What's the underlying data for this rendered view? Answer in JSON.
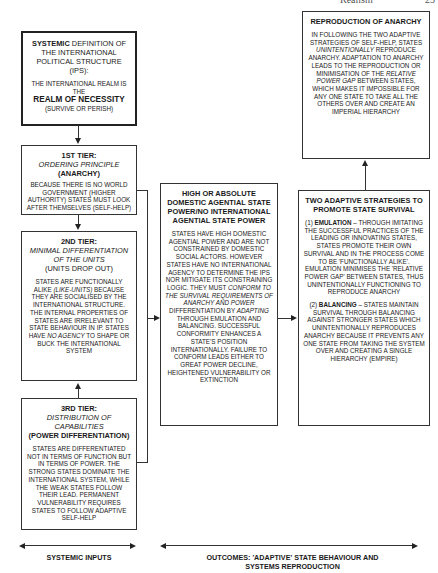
{
  "page_header": {
    "running_title": "Realism",
    "page_number": "25"
  },
  "left_column": {
    "systemic_definition": {
      "line1_bold": "SYSTEMIC",
      "line1_rest": " DEFINITION OF THE INTERNATIONAL POLITICAL STRUCTURE (IPS):",
      "body": "THE INTERNATIONAL REALM IS THE",
      "emphasis": "REALM OF NECESSITY",
      "note": "(SURVIVE OR PERISH)"
    },
    "tier1": {
      "title": "1ST TIER:",
      "subtitle": "ORDERING PRINCIPLE",
      "label": "(ANARCHY)",
      "body": "BECAUSE THERE IS NO WORLD GOVERNMENT (HIGHER AUTHORITY) STATES MUST LOOK AFTER THEMSELVES (SELF-HELP)"
    },
    "tier2": {
      "title": "2ND TIER:",
      "subtitle": "MINIMAL DIFFERENTIATION OF THE UNITS",
      "label": "(UNITS DROP OUT)",
      "body_a": "STATES ARE FUNCTIONALLY ALIKE ",
      "body_italic1": "(LIKE-UNITS)",
      "body_b": " BECAUSE THEY ARE SOCIALISED BY THE INTERNATIONAL STRUCTURE. THE INTERNAL PROPERTIES OF STATES ARE IRRELEVANT TO STATE BEHAVIOUR IN IP. STATES HAVE ",
      "body_italic2": "NO AGENCY",
      "body_c": " TO SHAPE OR BUCK THE INTERNATIONAL SYSTEM"
    },
    "tier3": {
      "title": "3RD TIER:",
      "subtitle": "DISTRIBUTION OF CAPABILITIES",
      "label": "(POWER DIFFERENTIATION)",
      "body": "STATES ARE DIFFERENTIATED NOT IN TERMS OF FUNCTION BUT IN TERMS OF POWER. THE STRONG STATES DOMINATE THE INTERNATIONAL SYSTEM, WHILE THE WEAK STATES FOLLOW THEIR LEAD. PERMANENT VULNERABILITY REQUIRES STATES TO FOLLOW ADAPTIVE SELF-HELP"
    }
  },
  "middle_column": {
    "agential_power": {
      "title": "HIGH OR ABSOLUTE DOMESTIC AGENTIAL STATE POWER/NO INTERNATIONAL AGENTIAL STATE POWER",
      "body_a": "STATES HAVE HIGH DOMESTIC AGENTIAL POWER AND ARE NOT CONSTRAINED BY DOMESTIC SOCIAL ACTORS. HOWEVER STATES HAVE NO INTERNATIONAL AGENCY TO DETERMINE THE IPS NOR MITIGATE ITS CONSTRAINING LOGIC. THEY MUST ",
      "body_italic1": "CONFORM TO THE SURVIVAL REQUIREMENTS OF ANARCHY AND POWER",
      "body_b": " DIFFERENTIATION BY ",
      "body_italic2": "ADAPTING",
      "body_c": " THROUGH EMULATION AND BALANCING. SUCCESSFUL CONFORMITY ENHANCES A STATE'S POSITION INTERNATIONALLY. FAILURE TO CONFORM LEADS EITHER TO GREAT POWER DECLINE, HEIGHTENED VULNERABILITY OR EXTINCTION"
    }
  },
  "right_column": {
    "reproduction": {
      "title": "REPRODUCTION OF ANARCHY",
      "body_a": "IN FOLLOWING THE TWO ADAPTIVE STRATEGIES OF SELF-HELP, STATES ",
      "body_italic1": "UNINTENTIONALLY",
      "body_b": " REPRODUCE ANARCHY. ADAPTATION TO ANARCHY LEADS TO THE REPRODUCTION OR MINIMISATION OF THE ",
      "body_italic2": "RELATIVE POWER GAP",
      "body_c": " BETWEEN STATES, WHICH MAKES IT IMPOSSIBLE FOR ANY ONE STATE TO TAKE ALL THE OTHERS OVER AND CREATE AN IMPERIAL HIERARCHY"
    },
    "strategies": {
      "title": "TWO ADAPTIVE STRATEGIES TO PROMOTE STATE SURVIVAL",
      "s1_num": "(1) ",
      "s1_name": "EMULATION",
      "s1_body": " – THROUGH IMITATING THE SUCCESSFUL PRACTICES OF THE LEADING OR INNOVATING STATES, STATES PROMOTE THEIR OWN SURVIVAL AND IN THE PROCESS COME TO BE 'FUNCTIONALLY ALIKE'. EMULATION MINIMISES THE 'RELATIVE POWER GAP' BETWEEN STATES, THUS UNINTENTIONALLY FUNCTIONING TO REPRODUCE ANARCHY",
      "s2_num": "(2) ",
      "s2_name": "BALANCING",
      "s2_body": " – STATES MAINTAIN SURVIVAL THROUGH BALANCING AGAINST STRONGER STATES WHICH UNINTENTIONALLY REPRODUCES ANARCHY BECAUSE IT PREVENTS ANY ONE STATE FROM TAKING THE SYSTEM OVER AND CREATING A SINGLE HIERARCHY (EMPIRE)"
    }
  },
  "footer": {
    "left_label": "SYSTEMIC INPUTS",
    "right_label": "OUTCOMES: 'ADAPTIVE' STATE BEHAVIOUR AND SYSTEMS REPRODUCTION"
  }
}
